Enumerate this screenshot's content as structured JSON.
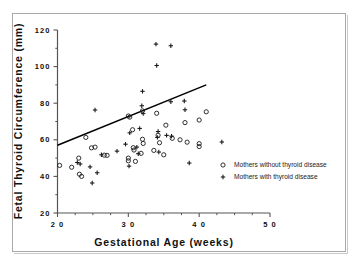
{
  "chart_data": {
    "type": "scatter",
    "title": "",
    "xlabel": "Gestational Age (weeks)",
    "ylabel": "Fetal Thyroid Circumference (mm)",
    "xlim": [
      20,
      50
    ],
    "ylim": [
      20,
      120
    ],
    "xticks": [
      20,
      30,
      40,
      50
    ],
    "yticks": [
      20,
      40,
      60,
      80,
      100,
      120
    ],
    "xtick_labels": [
      "2 0",
      "3 0",
      "4 0",
      "5 0"
    ],
    "ytick_labels": [
      "20",
      "40",
      "60",
      "80",
      "100",
      "120"
    ],
    "xtick_minor": [
      22.5,
      25,
      27.5,
      32.5,
      35,
      37.5,
      42.5,
      45,
      47.5
    ],
    "ytick_minor": [
      30,
      50,
      70,
      90,
      110
    ],
    "grid": false,
    "legend_position": "center-right-inside",
    "marker_color": "#1a1a1a",
    "line_color": "#000000",
    "axis_color": "#555555",
    "frame_color": "#a8a8a8",
    "series": [
      {
        "name": "Mothers without thyroid disease",
        "marker": "circle",
        "points": [
          [
            20.3,
            46.0
          ],
          [
            22.0,
            45.0
          ],
          [
            23.0,
            50.0
          ],
          [
            23.1,
            41.2
          ],
          [
            23.4,
            40.0
          ],
          [
            24.0,
            61.3
          ],
          [
            24.8,
            55.6
          ],
          [
            25.3,
            56.0
          ],
          [
            26.6,
            51.6
          ],
          [
            27.0,
            51.5
          ],
          [
            30.0,
            73.0
          ],
          [
            30.2,
            72.4
          ],
          [
            30.0,
            50.0
          ],
          [
            30.0,
            48.5
          ],
          [
            30.6,
            65.5
          ],
          [
            30.7,
            55.7
          ],
          [
            30.8,
            54.4
          ],
          [
            31.0,
            48.2
          ],
          [
            31.8,
            52.6
          ],
          [
            32.0,
            75.8
          ],
          [
            32.1,
            58.0
          ],
          [
            32.0,
            60.3
          ],
          [
            33.6,
            54.2
          ],
          [
            34.0,
            74.5
          ],
          [
            34.2,
            62.5
          ],
          [
            34.4,
            58.4
          ],
          [
            35.3,
            68.0
          ],
          [
            35.0,
            51.8
          ],
          [
            36.2,
            60.8
          ],
          [
            37.3,
            60.0
          ],
          [
            38.0,
            69.4
          ],
          [
            38.3,
            58.7
          ],
          [
            40.0,
            70.8
          ],
          [
            40.0,
            57.9
          ],
          [
            40.0,
            56.3
          ],
          [
            41.0,
            75.3
          ]
        ]
      },
      {
        "name": "Mothers with thyroid disease",
        "marker": "plus",
        "points": [
          [
            22.8,
            47.6
          ],
          [
            23.2,
            46.8
          ],
          [
            24.6,
            45.2
          ],
          [
            24.9,
            36.4
          ],
          [
            25.3,
            76.3
          ],
          [
            25.6,
            42.0
          ],
          [
            26.2,
            51.8
          ],
          [
            28.4,
            53.8
          ],
          [
            29.6,
            57.6
          ],
          [
            30.2,
            63.8
          ],
          [
            30.1,
            45.6
          ],
          [
            31.2,
            56.0
          ],
          [
            31.4,
            52.4
          ],
          [
            32.0,
            86.5
          ],
          [
            31.9,
            78.6
          ],
          [
            32.1,
            74.3
          ],
          [
            31.6,
            66.2
          ],
          [
            33.9,
            112.3
          ],
          [
            34.0,
            100.6
          ],
          [
            34.2,
            64.5
          ],
          [
            34.1,
            61.3
          ],
          [
            34.3,
            53.3
          ],
          [
            35.4,
            62.4
          ],
          [
            36.0,
            111.4
          ],
          [
            36.0,
            80.8
          ],
          [
            36.1,
            62.0
          ],
          [
            37.9,
            81.2
          ],
          [
            38.0,
            76.4
          ],
          [
            38.6,
            47.3
          ],
          [
            43.2,
            58.8
          ]
        ]
      }
    ],
    "trend_line": {
      "label": "",
      "x": [
        20.0,
        41.0
      ],
      "y": [
        57.0,
        90.0
      ]
    }
  },
  "legend": {
    "items": [
      {
        "marker": "circle",
        "label": "Mothers without thyroid disease"
      },
      {
        "marker": "plus",
        "label": "Mothers with thyroid disease"
      }
    ]
  }
}
